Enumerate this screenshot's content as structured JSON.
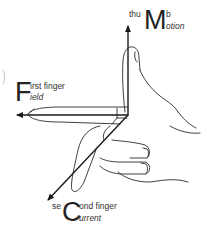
{
  "diagram": {
    "thumb": {
      "prefix": "thu",
      "initial": "M",
      "suffix": "b",
      "meaning_rest": "otion",
      "full_top": "thuMb",
      "full_bottom": "Motion"
    },
    "first_finger": {
      "initial": "F",
      "top_rest": "irst finger",
      "bottom_rest": "ield",
      "full_top": "First finger",
      "full_bottom": "Field"
    },
    "second_finger": {
      "prefix": "se",
      "initial": "C",
      "top_rest": "ond finger",
      "bottom_rest": "urrent",
      "full_top": "seCond finger",
      "full_bottom": "Current"
    },
    "colors": {
      "line": "#1a1a1a",
      "background": "#ffffff"
    }
  }
}
